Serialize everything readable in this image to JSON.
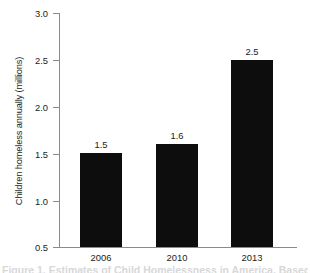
{
  "chart_data": {
    "type": "bar",
    "title": "",
    "xlabel": "",
    "ylabel": "Children homeless annually (millions)",
    "categories": [
      "2006",
      "2010",
      "2013"
    ],
    "values": [
      1.5,
      1.6,
      2.5
    ],
    "value_labels": [
      "1.5",
      "1.6",
      "2.5"
    ],
    "ylim": [
      0.5,
      3.0
    ],
    "ytick_values": [
      0.5,
      1.0,
      1.5,
      2.0,
      2.5,
      3.0
    ],
    "ytick_labels": [
      "0.5",
      "1.0",
      "1.5",
      "2.0",
      "2.5",
      "3.0"
    ],
    "grid": false,
    "legend": false,
    "legend_position": "none",
    "bar_color": "#0d0d0d",
    "axis_color": "#8a8a8a",
    "background_color": "#ffffff",
    "text_color": "#222222"
  },
  "axis": {
    "y_title": "Children homeless annually (millions)",
    "ytick_0": "3.0",
    "ytick_1": "2.5",
    "ytick_2": "2.0",
    "ytick_3": "1.5",
    "ytick_4": "1.0",
    "ytick_5": "0.5"
  },
  "bars": [
    {
      "category": "2006",
      "value_label": "1.5"
    },
    {
      "category": "2010",
      "value_label": "1.6"
    },
    {
      "category": "2013",
      "value_label": "2.5"
    }
  ],
  "caption": {
    "cut_off_text": "Figure 1. Estimates of Child Homelessness in America, Based on"
  }
}
